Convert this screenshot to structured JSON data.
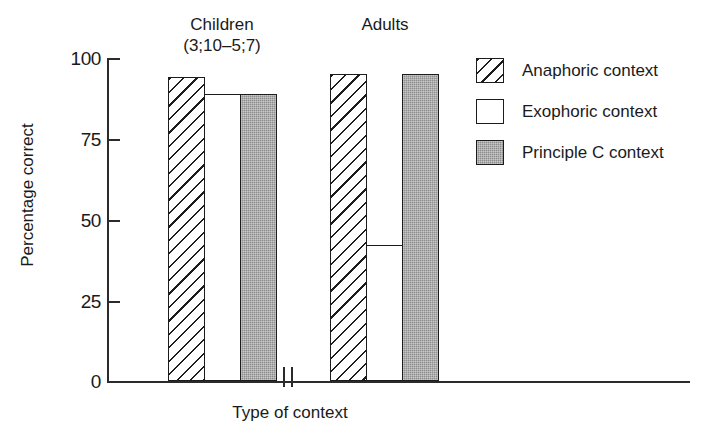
{
  "chart_data": {
    "type": "bar",
    "title": "",
    "xlabel": "Type of context",
    "ylabel": "Percentage correct",
    "ylim": [
      0,
      100
    ],
    "yticks": [
      0,
      25,
      50,
      75,
      100
    ],
    "ytick_labels": [
      "0",
      "25",
      "50",
      "75",
      "100"
    ],
    "grid": false,
    "axis_break": true,
    "legend_position": "right",
    "categories": [
      "Children (3;10–5;7)",
      "Adults"
    ],
    "group_labels": [
      {
        "line1": "Children",
        "line2": "(3;10–5;7)"
      },
      {
        "line1": "Adults",
        "line2": ""
      }
    ],
    "series": [
      {
        "name": "Anaphoric context",
        "fill": "diagonal-hatch",
        "values": [
          94,
          95
        ]
      },
      {
        "name": "Exophoric context",
        "fill": "white",
        "values": [
          89,
          42
        ]
      },
      {
        "name": "Principle C context",
        "fill": "gray-stipple",
        "values": [
          89,
          95
        ]
      }
    ]
  },
  "legend": {
    "items": [
      {
        "label": "Anaphoric context",
        "swatch": "diagonal-hatch"
      },
      {
        "label": "Exophoric context",
        "swatch": "white"
      },
      {
        "label": "Principle C context",
        "swatch": "gray-stipple"
      }
    ]
  },
  "colors": {
    "axis": "#2b2b2b",
    "bar_outline": "#1c1c1c",
    "gray_fill": "#8d8d8d",
    "background": "#ffffff"
  }
}
